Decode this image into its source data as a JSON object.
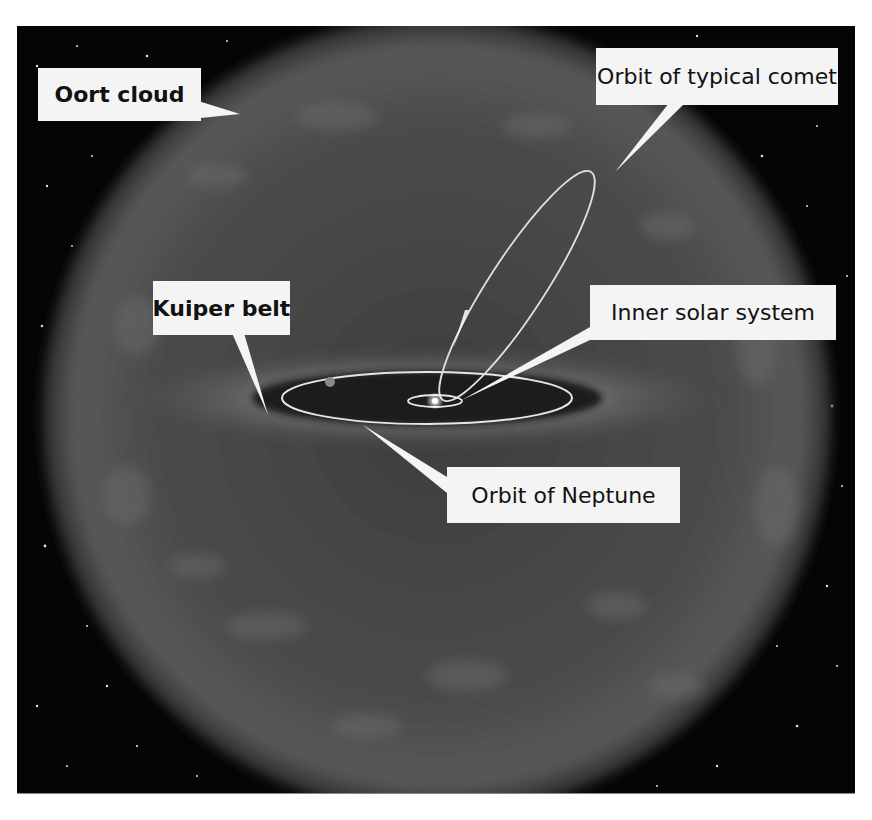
{
  "diagram": {
    "background_color": "#050505",
    "cloud_color": "#5a5a5a",
    "orbit_color": "#e6e6e6",
    "label_bg": "#f4f4f4",
    "labels": [
      {
        "id": "oort-cloud",
        "text": "Oort cloud",
        "bold": true
      },
      {
        "id": "orbit-typical-comet",
        "text": "Orbit of typical comet",
        "bold": false
      },
      {
        "id": "kuiper-belt",
        "text": "Kuiper belt",
        "bold": true
      },
      {
        "id": "inner-solar-system",
        "text": "Inner solar system",
        "bold": false
      },
      {
        "id": "orbit-neptune",
        "text": "Orbit of Neptune",
        "bold": false
      }
    ],
    "elements": [
      {
        "id": "oort-cloud-sphere",
        "shape": "sphere",
        "description": "Hazy spherical cloud surrounding the solar system"
      },
      {
        "id": "kuiper-belt-disk",
        "shape": "flattened disk",
        "description": "Bright band extending beyond Neptune's orbit"
      },
      {
        "id": "neptune-orbit",
        "shape": "ellipse"
      },
      {
        "id": "inner-orbit",
        "shape": "small ellipse"
      },
      {
        "id": "comet-orbit",
        "shape": "elongated tilted ellipse"
      },
      {
        "id": "sun",
        "shape": "bright dot"
      }
    ]
  }
}
